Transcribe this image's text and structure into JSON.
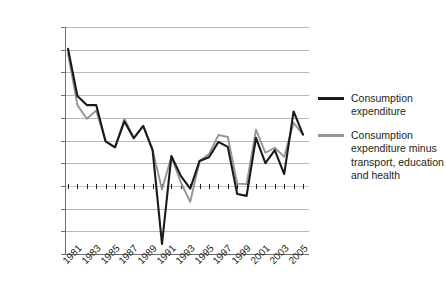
{
  "chart_data": {
    "type": "line",
    "title": "",
    "xlabel": "",
    "ylabel": "",
    "grid": true,
    "legend_position": "right",
    "ylim": [
      -0.15,
      0.35
    ],
    "ytick_labels": [
      "35.00%",
      "30.00%",
      "25.00%",
      "20.00%",
      "15.00%",
      "10.00%",
      "5.00%",
      "0.00%",
      "−5.00%",
      "−10.00%",
      "−15.00%"
    ],
    "ytick_values": [
      0.35,
      0.3,
      0.25,
      0.2,
      0.15,
      0.1,
      0.05,
      0.0,
      -0.05,
      -0.1,
      -0.15
    ],
    "x": [
      1981,
      1982,
      1983,
      1984,
      1985,
      1986,
      1987,
      1988,
      1989,
      1990,
      1991,
      1992,
      1993,
      1994,
      1995,
      1996,
      1997,
      1998,
      1999,
      2000,
      2001,
      2002,
      2003,
      2004,
      2005,
      2006
    ],
    "xtick_labels": [
      "1981",
      "1983",
      "1985",
      "1987",
      "1989",
      "1991",
      "1993",
      "1995",
      "1997",
      "1999",
      "2001",
      "2003",
      "2005"
    ],
    "series": [
      {
        "name": "Consumption expenditure",
        "color": "#1a1a1a",
        "values": [
          0.302,
          0.198,
          0.178,
          0.178,
          0.098,
          0.085,
          0.142,
          0.105,
          0.132,
          0.079,
          -0.128,
          0.066,
          0.022,
          -0.006,
          0.055,
          0.063,
          0.097,
          0.086,
          -0.018,
          -0.022,
          0.106,
          0.05,
          0.079,
          0.026,
          0.164,
          0.113
        ]
      },
      {
        "name": "Consumption expenditure minus transport, education and health",
        "color": "#959595",
        "values": [
          0.292,
          0.178,
          0.148,
          0.166,
          0.098,
          0.085,
          0.148,
          0.105,
          0.132,
          0.079,
          -0.008,
          0.064,
          0.008,
          -0.035,
          0.055,
          0.07,
          0.112,
          0.108,
          0.005,
          0.004,
          0.124,
          0.073,
          0.084,
          0.064,
          0.139,
          0.113
        ]
      }
    ]
  },
  "legend": {
    "entries": [
      {
        "label": "Consumption expenditure",
        "color": "#1a1a1a",
        "swatch_name": "legend-swatch-consumption-expenditure"
      },
      {
        "label": "Consumption expenditure minus transport, education and health",
        "color": "#959595",
        "swatch_name": "legend-swatch-consumption-expenditure-minus"
      }
    ]
  }
}
